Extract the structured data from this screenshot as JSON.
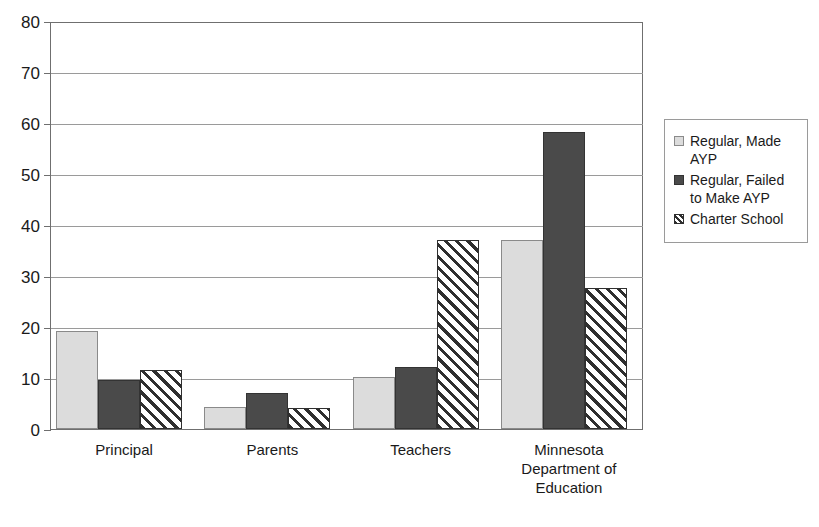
{
  "chart_data": {
    "type": "bar",
    "title": "",
    "xlabel": "",
    "ylabel": "",
    "ylim": [
      0,
      80
    ],
    "yticks": [
      0,
      10,
      20,
      30,
      40,
      50,
      60,
      70,
      80
    ],
    "grid": true,
    "legend_position": "right",
    "categories": [
      "Principal",
      "Parents",
      "Teachers",
      "Minnesota Department of Education"
    ],
    "category_label_lines": [
      [
        "Principal"
      ],
      [
        "Parents"
      ],
      [
        "Teachers"
      ],
      [
        "Minnesota",
        "Department of",
        "Education"
      ]
    ],
    "series": [
      {
        "name": "Regular, Made AYP",
        "color": "#dcdcdc",
        "pattern": "solid-light",
        "values": [
          19.3,
          4.3,
          10.2,
          37.0
        ]
      },
      {
        "name": "Regular, Failed to Make AYP",
        "color": "#4a4a4a",
        "pattern": "solid-dark",
        "values": [
          9.6,
          7.1,
          12.2,
          58.2
        ]
      },
      {
        "name": "Charter School",
        "color": "#ffffff",
        "pattern": "diagonal-hatch",
        "values": [
          11.6,
          4.2,
          37.1,
          27.6
        ]
      }
    ]
  },
  "legend": {
    "items": [
      {
        "label": "Regular, Made AYP",
        "swatch": "legend-swatch-regular-made-ayp"
      },
      {
        "label": "Regular, Failed to Make AYP",
        "swatch": "legend-swatch-regular-failed-ayp"
      },
      {
        "label": "Charter School",
        "swatch": "legend-swatch-charter-school"
      }
    ]
  },
  "axis": {
    "y_tick_labels": [
      "80",
      "70",
      "60",
      "50",
      "40",
      "30",
      "20",
      "10",
      "0"
    ]
  }
}
